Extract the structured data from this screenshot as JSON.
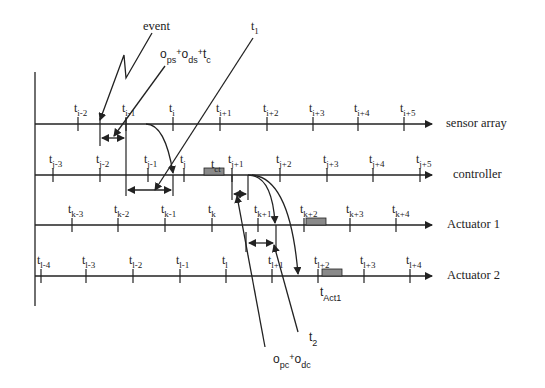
{
  "diagram": {
    "type": "timing-diagram",
    "axes": [
      {
        "id": "sensor",
        "label": "sensor array",
        "y": 124,
        "ticks": [
          {
            "x": 78,
            "base": "t",
            "sub": "i-2"
          },
          {
            "x": 126,
            "base": "t",
            "sub": "i-1"
          },
          {
            "x": 173,
            "base": "t",
            "sub": "i"
          },
          {
            "x": 220,
            "base": "t",
            "sub": "i+1"
          },
          {
            "x": 267,
            "base": "t",
            "sub": "i+2"
          },
          {
            "x": 313,
            "base": "t",
            "sub": "i+3"
          },
          {
            "x": 358,
            "base": "t",
            "sub": "i+4"
          },
          {
            "x": 404,
            "base": "t",
            "sub": "i+5"
          }
        ]
      },
      {
        "id": "controller",
        "label": "controller",
        "y": 175,
        "ticks": [
          {
            "x": 53,
            "base": "t",
            "sub": "j-3"
          },
          {
            "x": 100,
            "base": "t",
            "sub": "j-2"
          },
          {
            "x": 148,
            "base": "t",
            "sub": "j-1"
          },
          {
            "x": 184,
            "base": "t",
            "sub": "j"
          },
          {
            "x": 232,
            "base": "t",
            "sub": "j+1"
          },
          {
            "x": 280,
            "base": "t",
            "sub": "j+2"
          },
          {
            "x": 327,
            "base": "t",
            "sub": "j+3"
          },
          {
            "x": 373,
            "base": "t",
            "sub": "j+4"
          },
          {
            "x": 420,
            "base": "t",
            "sub": "j+5"
          }
        ]
      },
      {
        "id": "actuator1",
        "label": "Actuator 1",
        "y": 225,
        "ticks": [
          {
            "x": 72,
            "base": "t",
            "sub": "k-3"
          },
          {
            "x": 118,
            "base": "t",
            "sub": "k-2"
          },
          {
            "x": 165,
            "base": "t",
            "sub": "k-1"
          },
          {
            "x": 212,
            "base": "t",
            "sub": "k"
          },
          {
            "x": 258,
            "base": "t",
            "sub": "k+1"
          },
          {
            "x": 304,
            "base": "t",
            "sub": "k+2"
          },
          {
            "x": 350,
            "base": "t",
            "sub": "k+3"
          },
          {
            "x": 396,
            "base": "t",
            "sub": "k+4"
          }
        ]
      },
      {
        "id": "actuator2",
        "label": "Actuator 2",
        "y": 276,
        "ticks": [
          {
            "x": 41,
            "base": "t",
            "sub": "l-4"
          },
          {
            "x": 86,
            "base": "t",
            "sub": "l-3"
          },
          {
            "x": 133,
            "base": "t",
            "sub": "l-2"
          },
          {
            "x": 180,
            "base": "t",
            "sub": "l-1"
          },
          {
            "x": 226,
            "base": "t",
            "sub": "l"
          },
          {
            "x": 272,
            "base": "t",
            "sub": "l+1"
          },
          {
            "x": 318,
            "base": "t",
            "sub": "l+2"
          },
          {
            "x": 364,
            "base": "t",
            "sub": "l+3"
          },
          {
            "x": 410,
            "base": "t",
            "sub": "l+4"
          }
        ]
      }
    ],
    "annotations": {
      "event": "event",
      "offset_sensor": {
        "o1": "o",
        "s1": "ps",
        "plus1": "+",
        "o2": "o",
        "s2": "ds",
        "plus2": "+",
        "t": "t",
        "s3": "c"
      },
      "t1": {
        "base": "t",
        "sub": "1"
      },
      "t2": {
        "base": "t",
        "sub": "2"
      },
      "tct": {
        "base": "t",
        "sub": "ct"
      },
      "tact1": {
        "base": "t",
        "sub": "Act1"
      },
      "offset_controller": {
        "o1": "o",
        "s1": "pc",
        "plus": "+",
        "o2": "o",
        "s2": "dc"
      }
    },
    "colors": {
      "line": "#222222",
      "block_fill": "#8a8a8a",
      "background": "#ffffff"
    }
  }
}
